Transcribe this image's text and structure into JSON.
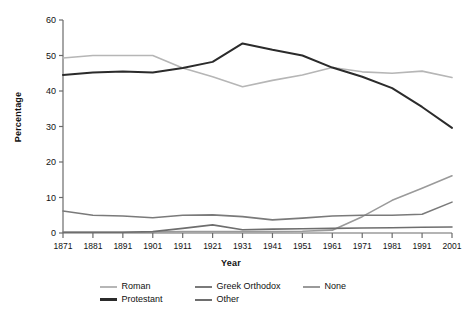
{
  "chart_data": {
    "type": "line",
    "title": "",
    "xlabel": "Year",
    "ylabel": "Percentage",
    "categories": [
      1871,
      1881,
      1891,
      1901,
      1911,
      1921,
      1931,
      1941,
      1951,
      1961,
      1971,
      1981,
      1991,
      2001
    ],
    "x": [
      "1871",
      "1881",
      "1891",
      "1901",
      "1911",
      "1921",
      "1931",
      "1941",
      "1951",
      "1961",
      "1971",
      "1981",
      "1991",
      "2001"
    ],
    "xlim": [
      1871,
      2001
    ],
    "ylim": [
      0,
      60
    ],
    "yticks": [
      0,
      10,
      20,
      30,
      40,
      50,
      60
    ],
    "yticklabels": [
      "0",
      "10",
      "20",
      "30",
      "40",
      "50",
      "60"
    ],
    "xticklabels": [
      "1871",
      "1881",
      "1891",
      "1901",
      "1911",
      "1921",
      "1931",
      "1941",
      "1951",
      "1961",
      "1971",
      "1981",
      "1991",
      "2001"
    ],
    "grid": false,
    "legend_position": "bottom",
    "series": [
      {
        "name": "Roman",
        "color": "#b6b6b6",
        "width": 1.6,
        "values": [
          49.3,
          50.0,
          50.0,
          50.0,
          46.5,
          44.0,
          41.2,
          43.0,
          44.5,
          46.6,
          45.4,
          45.0,
          45.6,
          43.8
        ]
      },
      {
        "name": "Protestant",
        "color": "#2b2b2b",
        "width": 2.0,
        "values": [
          44.5,
          45.2,
          45.5,
          45.2,
          46.5,
          48.2,
          53.4,
          51.6,
          50.0,
          46.6,
          44.0,
          40.8,
          35.5,
          29.6
        ]
      },
      {
        "name": "Greek Orthodox",
        "color": "#7a7a7a",
        "width": 1.6,
        "values": [
          6.2,
          5.0,
          4.8,
          4.3,
          5.0,
          5.1,
          4.6,
          3.7,
          4.2,
          4.8,
          5.0,
          5.0,
          5.3,
          8.7
        ]
      },
      {
        "name": "None",
        "color": "#9a9a9a",
        "width": 1.6,
        "values": [
          0.2,
          0.2,
          0.2,
          0.3,
          0.4,
          0.4,
          0.4,
          0.4,
          0.5,
          0.8,
          4.6,
          9.2,
          12.6,
          16.1
        ]
      },
      {
        "name": "Other",
        "color": "#6e6e6e",
        "width": 1.6,
        "values": [
          0.2,
          0.2,
          0.2,
          0.4,
          1.3,
          2.3,
          0.9,
          1.1,
          1.2,
          1.3,
          1.4,
          1.5,
          1.6,
          1.7
        ]
      }
    ]
  },
  "legend": {
    "row1": [
      {
        "label": "Roman",
        "color": "#b6b6b6",
        "width": 2
      },
      {
        "label": "Greek Orthodox",
        "color": "#7a7a7a",
        "width": 2
      },
      {
        "label": "None",
        "color": "#9a9a9a",
        "width": 2
      }
    ],
    "row2": [
      {
        "label": "Protestant",
        "color": "#2b2b2b",
        "width": 3
      },
      {
        "label": "Other",
        "color": "#6e6e6e",
        "width": 2
      }
    ]
  },
  "axis": {
    "y_title": "Percentage",
    "x_title": "Year"
  },
  "colors": {
    "axis": "#6b6b6b",
    "text": "#111111",
    "background": "#ffffff"
  }
}
